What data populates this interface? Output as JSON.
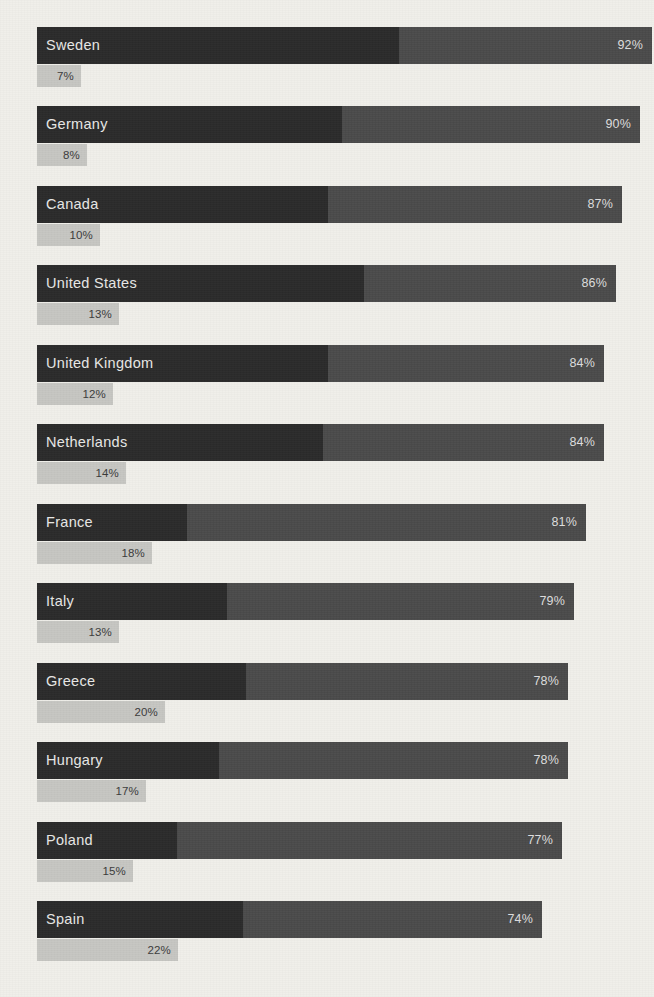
{
  "chart_data": {
    "type": "bar",
    "title": "",
    "subtitle": "",
    "xlabel": "",
    "ylabel": "",
    "orientation": "horizontal",
    "grid": false,
    "legend_position": "none",
    "axis_range_main": [
      0,
      100
    ],
    "axis_range_sub": [
      0,
      100
    ],
    "categories": [
      "Sweden",
      "Germany",
      "Canada",
      "United States",
      "United Kingdom",
      "Netherlands",
      "France",
      "Italy",
      "Greece",
      "Hungary",
      "Poland",
      "Spain"
    ],
    "series": [
      {
        "name": "primary",
        "values": [
          92,
          90,
          87,
          86,
          84,
          84,
          81,
          79,
          78,
          78,
          77,
          74
        ],
        "labels": [
          "92%",
          "90%",
          "87%",
          "86%",
          "84%",
          "84%",
          "81%",
          "79%",
          "78%",
          "78%",
          "77%",
          "74%"
        ],
        "color": "#4a4a4a"
      },
      {
        "name": "secondary",
        "values": [
          7,
          8,
          10,
          13,
          12,
          14,
          18,
          13,
          20,
          17,
          15,
          22
        ],
        "labels": [
          "7%",
          "8%",
          "10%",
          "13%",
          "12%",
          "14%",
          "18%",
          "13%",
          "20%",
          "17%",
          "15%",
          "22%"
        ],
        "color": "#c6c6c2"
      }
    ]
  },
  "rows": [
    {
      "country": "Sweden",
      "main_label": "92%",
      "sub_label": "7%",
      "main_width": 615,
      "dark_width": 362,
      "sub_width": 44,
      "top": 27
    },
    {
      "country": "Germany",
      "main_label": "90%",
      "sub_label": "8%",
      "main_width": 603,
      "dark_width": 305,
      "sub_width": 50,
      "top": 106
    },
    {
      "country": "Canada",
      "main_label": "87%",
      "sub_label": "10%",
      "main_width": 585,
      "dark_width": 291,
      "sub_width": 63,
      "top": 186
    },
    {
      "country": "United States",
      "main_label": "86%",
      "sub_label": "13%",
      "main_width": 579,
      "dark_width": 327,
      "sub_width": 82,
      "top": 265
    },
    {
      "country": "United Kingdom",
      "main_label": "84%",
      "sub_label": "12%",
      "main_width": 567,
      "dark_width": 291,
      "sub_width": 76,
      "top": 345
    },
    {
      "country": "Netherlands",
      "main_label": "84%",
      "sub_label": "14%",
      "main_width": 567,
      "dark_width": 286,
      "sub_width": 89,
      "top": 424
    },
    {
      "country": "France",
      "main_label": "81%",
      "sub_label": "18%",
      "main_width": 549,
      "dark_width": 150,
      "sub_width": 115,
      "top": 504
    },
    {
      "country": "Italy",
      "main_label": "79%",
      "sub_label": "13%",
      "main_width": 537,
      "dark_width": 190,
      "sub_width": 82,
      "top": 583
    },
    {
      "country": "Greece",
      "main_label": "78%",
      "sub_label": "20%",
      "main_width": 531,
      "dark_width": 209,
      "sub_width": 128,
      "top": 663
    },
    {
      "country": "Hungary",
      "main_label": "78%",
      "sub_label": "17%",
      "main_width": 531,
      "dark_width": 182,
      "sub_width": 109,
      "top": 742
    },
    {
      "country": "Poland",
      "main_label": "77%",
      "sub_label": "15%",
      "main_width": 525,
      "dark_width": 140,
      "sub_width": 96,
      "top": 822
    },
    {
      "country": "Spain",
      "main_label": "74%",
      "sub_label": "22%",
      "main_width": 505,
      "dark_width": 206,
      "sub_width": 141,
      "top": 901
    }
  ],
  "colors": {
    "background": "#f0efea",
    "bar_dark": "#2a2a2a",
    "bar_medium": "#4a4a4a",
    "bar_light": "#c6c6c2",
    "label_text": "#e8e8e6",
    "sub_text": "#3a3a3a"
  }
}
